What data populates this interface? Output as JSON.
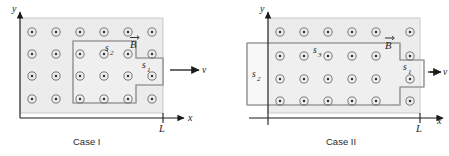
{
  "figure": {
    "caption_field_symbol": "B",
    "velocity_symbol": "v",
    "axis_x": "x",
    "axis_y": "y",
    "tick_label": "L",
    "field_direction": "out-of-page",
    "field_marker": "dot-in-circle"
  },
  "colors": {
    "field_region_fill": "#ececec",
    "field_region_stroke": "#c9c9c9",
    "loop_stroke": "#9a9a9a",
    "loop_fill": "#f2f2f2",
    "dot_ring": "#6b6b6b",
    "dot_center": "#333333",
    "axis": "#1a1a1a",
    "text": "#1a1a1a",
    "caption_text": "#2b2b2b",
    "background": "#ffffff"
  },
  "cases": [
    {
      "id": "case-1",
      "caption": "Case I",
      "field_label": "B",
      "velocity_label": "v",
      "axis_x_label": "x",
      "axis_y_label": "y",
      "tick_label": "L",
      "dot_grid": {
        "columns": 6,
        "rows": 4
      },
      "loops": [
        {
          "name": "s2",
          "base": "s",
          "subscript": "2"
        },
        {
          "name": "s1",
          "base": "s",
          "subscript": "1"
        }
      ]
    },
    {
      "id": "case-2",
      "caption": "Case II",
      "field_label": "B",
      "velocity_label": "v",
      "axis_x_label": "x",
      "axis_y_label": "y",
      "tick_label": "L",
      "dot_grid": {
        "columns": 6,
        "rows": 4
      },
      "loops": [
        {
          "name": "s2",
          "base": "s",
          "subscript": "2"
        },
        {
          "name": "s3",
          "base": "s",
          "subscript": "3"
        },
        {
          "name": "s1",
          "base": "s",
          "subscript": "1"
        }
      ]
    }
  ]
}
